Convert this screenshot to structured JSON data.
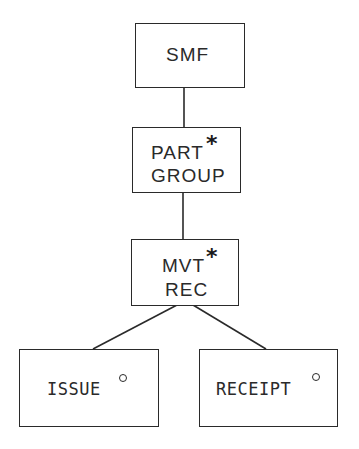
{
  "diagram": {
    "type": "hierarchy",
    "stroke_color": "#2a2a2a",
    "background": "#ffffff",
    "nodes": {
      "smf": {
        "label": "SMF",
        "marker": ""
      },
      "part_group": {
        "line1": "PART",
        "line2": "GROUP",
        "marker": "*",
        "marker_meaning": "iteration"
      },
      "mvt_rec": {
        "line1": "MVT",
        "line2": "REC",
        "marker": "*",
        "marker_meaning": "iteration"
      },
      "issue": {
        "label": "ISSUE",
        "marker": "°",
        "marker_meaning": "selection"
      },
      "receipt": {
        "label": "RECEIPT",
        "marker": "°",
        "marker_meaning": "selection"
      }
    },
    "edges": [
      {
        "from": "SMF",
        "to": "PART GROUP"
      },
      {
        "from": "PART GROUP",
        "to": "MVT REC"
      },
      {
        "from": "MVT REC",
        "to": "ISSUE"
      },
      {
        "from": "MVT REC",
        "to": "RECEIPT"
      }
    ]
  }
}
